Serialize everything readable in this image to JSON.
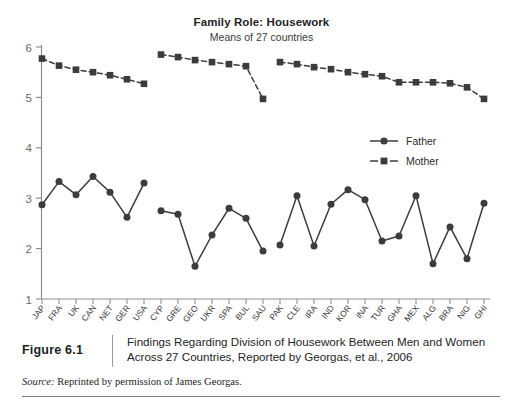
{
  "figure": {
    "number_label": "Figure 6.1",
    "caption": "Findings Regarding Division of Housework Between Men and Women Across 27 Countries, Reported by Georgas, et al., 2006",
    "source_prefix": "Source:",
    "source_text": " Reprinted by permission of James Georgas."
  },
  "chart_data": {
    "type": "line",
    "title": "Family Role: Housework",
    "subtitle": "Means of 27 countries",
    "xlabel": "",
    "ylabel": "",
    "ylim": [
      1,
      6
    ],
    "yticks": [
      1,
      2,
      3,
      4,
      5,
      6
    ],
    "ytick_labels": [
      "1",
      "2",
      "3",
      "4",
      "5",
      "6"
    ],
    "grid": false,
    "legend_position": "right-middle",
    "categories": [
      "JAP",
      "FRA",
      "UK",
      "CAN",
      "NET",
      "GER",
      "USA",
      "CYP",
      "GRE",
      "GEO",
      "UKR",
      "SPA",
      "BUL",
      "SAU",
      "PAK",
      "CLE",
      "IRA",
      "IND",
      "KOR",
      "INA",
      "TUR",
      "GHA",
      "MEX",
      "ALG",
      "BRA",
      "NIG",
      "GHI"
    ],
    "groups": [
      {
        "name": "group-1",
        "start_index": 0,
        "end_index": 6
      },
      {
        "name": "group-2",
        "start_index": 7,
        "end_index": 13
      },
      {
        "name": "group-3",
        "start_index": 14,
        "end_index": 26
      }
    ],
    "series": [
      {
        "name": "Father",
        "marker": "circle",
        "linestyle": "solid",
        "color": "#3c3c3c",
        "values": [
          2.87,
          3.33,
          3.07,
          3.43,
          3.12,
          2.62,
          3.3,
          2.75,
          2.68,
          1.65,
          2.27,
          2.8,
          2.6,
          1.95,
          2.07,
          3.05,
          2.05,
          2.88,
          3.17,
          2.97,
          2.15,
          2.25,
          3.05,
          1.7,
          2.43,
          1.8,
          2.9
        ]
      },
      {
        "name": "Mother",
        "marker": "square",
        "linestyle": "dashed",
        "color": "#3c3c3c",
        "values": [
          5.77,
          5.63,
          5.55,
          5.5,
          5.44,
          5.36,
          5.27,
          5.85,
          5.8,
          5.74,
          5.7,
          5.66,
          5.62,
          4.97,
          5.7,
          5.66,
          5.6,
          5.56,
          5.5,
          5.46,
          5.42,
          5.3,
          5.3,
          5.3,
          5.28,
          5.2,
          4.97
        ]
      }
    ],
    "legend": [
      {
        "label": "Father",
        "marker": "circle",
        "linestyle": "solid"
      },
      {
        "label": "Mother",
        "marker": "square",
        "linestyle": "dashed"
      }
    ]
  }
}
